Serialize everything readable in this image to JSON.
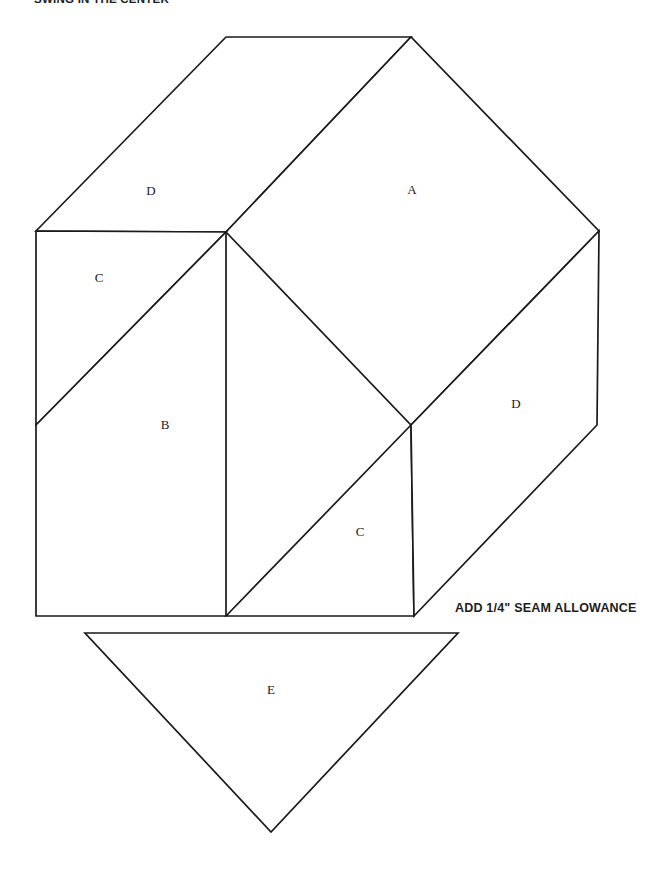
{
  "page": {
    "title": "SWING IN THE CENTER",
    "background_color": "#ffffff",
    "line_color": "#1a1a1a",
    "width": 655,
    "height": 883
  },
  "notes": {
    "seam_allowance": "ADD 1/4\" SEAM ALLOWANCE"
  },
  "labels": {
    "a": "A",
    "b": "B",
    "c_upper": "C",
    "c_lower": "C",
    "d_upper": "D",
    "d_right": "D",
    "e": "E"
  },
  "geometry": {
    "block": {
      "name": "main-block",
      "vertices": {
        "left_top": [
          36,
          231
        ],
        "left_bottom": [
          36,
          616
        ],
        "top_left_peak": [
          226,
          37
        ],
        "top_right_peak": [
          411,
          37
        ],
        "right_top": [
          599,
          231
        ],
        "right_bend": [
          597,
          425
        ],
        "bottom_right": [
          414,
          616
        ],
        "center_upper": [
          226,
          232
        ],
        "center_lower": [
          411,
          425
        ],
        "bottom_mid": [
          226,
          616
        ]
      }
    },
    "patches": [
      {
        "label": "D",
        "id": "patch-d-upper",
        "shape": "parallelogram",
        "points": "36,231 226,37 411,37 226,232"
      },
      {
        "label": "A",
        "id": "patch-a",
        "shape": "square",
        "points": "226,232 411,37 599,231 411,425"
      },
      {
        "label": "C",
        "id": "patch-c-upper",
        "shape": "triangle",
        "points": "36,231 226,232 36,425"
      },
      {
        "label": "B",
        "id": "patch-b",
        "shape": "triangle",
        "points": "36,425 226,232 226,616 36,616"
      },
      {
        "label": "C",
        "id": "patch-c-lower",
        "shape": "triangle",
        "points": "226,616 411,425 414,616"
      },
      {
        "label": "D",
        "id": "patch-d-right",
        "shape": "parallelogram",
        "points": "411,425 599,231 597,425 414,616"
      },
      {
        "label": "E",
        "id": "patch-e",
        "shape": "triangle",
        "points": "85,633 458,633 271,832"
      }
    ],
    "label_positions": {
      "d_upper": [
        151,
        192
      ],
      "a": [
        412,
        191
      ],
      "c_upper": [
        99,
        279
      ],
      "b": [
        165,
        426
      ],
      "c_lower": [
        360,
        533
      ],
      "d_right": [
        516,
        405
      ],
      "e": [
        271,
        691
      ]
    }
  }
}
